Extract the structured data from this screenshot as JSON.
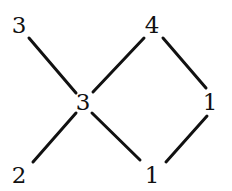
{
  "graph": {
    "title": "Labeled poset diagram",
    "background_color": "#ffffff",
    "edge_color": "#111111",
    "label_color": "#111111",
    "edge_width": 3,
    "width": 232,
    "height": 191,
    "nodes": [
      {
        "id": "n0",
        "label": "3",
        "x": 19,
        "y": 25
      },
      {
        "id": "n1",
        "label": "4",
        "x": 152,
        "y": 25
      },
      {
        "id": "n2",
        "label": "3",
        "x": 83,
        "y": 102
      },
      {
        "id": "n3",
        "label": "1",
        "x": 210,
        "y": 102
      },
      {
        "id": "n4",
        "label": "2",
        "x": 19,
        "y": 175
      },
      {
        "id": "n5",
        "label": "1",
        "x": 152,
        "y": 175
      }
    ],
    "edges": [
      {
        "id": "e0",
        "from": "n0",
        "to": "n2",
        "x1": 29,
        "y1": 38,
        "x2": 76,
        "y2": 93
      },
      {
        "id": "e1",
        "from": "n2",
        "to": "n1",
        "x1": 93,
        "y1": 92,
        "x2": 144,
        "y2": 38
      },
      {
        "id": "e2",
        "from": "n1",
        "to": "n3",
        "x1": 163,
        "y1": 38,
        "x2": 206,
        "y2": 88
      },
      {
        "id": "e3",
        "from": "n2",
        "to": "n4",
        "x1": 76,
        "y1": 113,
        "x2": 33,
        "y2": 162
      },
      {
        "id": "e4",
        "from": "n2",
        "to": "n5",
        "x1": 92,
        "y1": 113,
        "x2": 140,
        "y2": 160
      },
      {
        "id": "e5",
        "from": "n3",
        "to": "n5",
        "x1": 207,
        "y1": 116,
        "x2": 166,
        "y2": 162
      }
    ]
  }
}
